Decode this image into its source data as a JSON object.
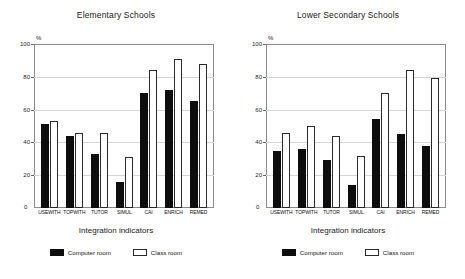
{
  "figure": {
    "background": "#ffffff",
    "bar_color_computer": "#0d0d0d",
    "bar_color_classroom": "#ffffff",
    "axis_color": "#8a8a8a",
    "grid_color": "#d6d6d6"
  },
  "panels": [
    {
      "title": "Elementary Schools",
      "axis_unit": "%",
      "xlabel": "Integration indicators",
      "zero_label": "0",
      "yticks": [
        "100",
        "80",
        "60",
        "40",
        "20",
        "0"
      ],
      "categories": [
        "USEWITH",
        "TOPWITH",
        "TUTOR",
        "SIMUL",
        "CAI",
        "ENRICH",
        "REMED"
      ],
      "legend": [
        {
          "label": "Computer room",
          "key": "computer"
        },
        {
          "label": "Class room",
          "key": "classroom"
        }
      ]
    },
    {
      "title": "Lower Secondary Schools",
      "axis_unit": "%",
      "xlabel": "Integration indicators",
      "zero_label": "0",
      "yticks": [
        "100",
        "80",
        "60",
        "40",
        "20",
        "0"
      ],
      "categories": [
        "USEWITH",
        "TOPWITH",
        "TUTOR",
        "SIMUL",
        "CAI",
        "ENRICH",
        "REMED"
      ],
      "legend": [
        {
          "label": "Computer room",
          "key": "computer"
        },
        {
          "label": "Class room",
          "key": "classroom"
        }
      ]
    }
  ],
  "chart_data": [
    {
      "type": "bar",
      "title": "Elementary Schools",
      "xlabel": "Integration indicators",
      "ylabel": "%",
      "ylim": [
        0,
        100
      ],
      "yticks": [
        0,
        20,
        40,
        60,
        80,
        100
      ],
      "grid": true,
      "legend_position": "bottom",
      "categories": [
        "USEWITH",
        "TOPWITH",
        "TUTOR",
        "SIMUL",
        "CAI",
        "ENRICH",
        "REMED"
      ],
      "series": [
        {
          "name": "Computer room",
          "color": "#0d0d0d",
          "values": [
            51,
            44,
            33,
            16,
            70,
            72,
            65
          ]
        },
        {
          "name": "Class room",
          "color": "#ffffff",
          "values": [
            53,
            46,
            46,
            31,
            84,
            91,
            88
          ]
        }
      ]
    },
    {
      "type": "bar",
      "title": "Lower Secondary Schools",
      "xlabel": "Integration indicators",
      "ylabel": "%",
      "ylim": [
        0,
        100
      ],
      "yticks": [
        0,
        20,
        40,
        60,
        80,
        100
      ],
      "grid": true,
      "legend_position": "bottom",
      "categories": [
        "USEWITH",
        "TOPWITH",
        "TUTOR",
        "SIMUL",
        "CAI",
        "ENRICH",
        "REMED"
      ],
      "series": [
        {
          "name": "Computer room",
          "color": "#0d0d0d",
          "values": [
            35,
            36,
            29,
            14,
            54,
            45,
            38
          ]
        },
        {
          "name": "Class room",
          "color": "#ffffff",
          "values": [
            46,
            50,
            44,
            32,
            70,
            84,
            79
          ]
        }
      ]
    }
  ]
}
